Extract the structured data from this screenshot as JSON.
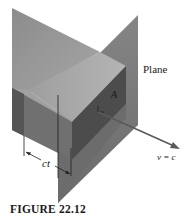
{
  "figure": {
    "caption": "FIGURE 22.12",
    "labels": {
      "plane": "Plane",
      "area": "A",
      "velocity": "v = c",
      "distance": "ct"
    },
    "colors": {
      "back_sheet": "#9a9a9a",
      "box_top": "#a8a8a8",
      "box_front_left": "#6e6e6e",
      "box_front_right": "#4a4a4a",
      "plane": "#7a7a7a",
      "arrow": "#5a5a5a",
      "background": "#ffffff"
    }
  }
}
